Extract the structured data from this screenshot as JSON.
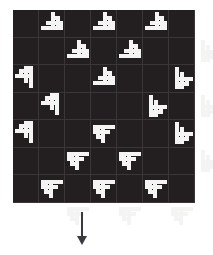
{
  "figure": {
    "kind": "pattern-grid-with-arrow",
    "background_color": "#ffffff",
    "arrow": {
      "direction": "down",
      "color": "#3a3a40",
      "x": 77,
      "y": 212,
      "length": 33,
      "shaft_width": 2,
      "head_width": 10,
      "head_height": 9
    }
  },
  "grid": {
    "x": 13,
    "y": 10,
    "width": 182,
    "height": 193,
    "columns": 7,
    "rows": 7,
    "cell_size": 26,
    "cell_color": "#231f20",
    "gridline_color": "#3b3538",
    "gridline_width": 1,
    "motif_color": "#f4f4f2",
    "motif_name": "staircase-pinwheel-block",
    "motif_unit": 26,
    "motif_bars": [
      {
        "x": 2,
        "y": 16,
        "w": 22,
        "h": 4
      },
      {
        "x": 7,
        "y": 11,
        "w": 17,
        "h": 4
      },
      {
        "x": 12,
        "y": 6,
        "w": 7,
        "h": 4
      },
      {
        "x": 12,
        "y": 2,
        "w": 4,
        "h": 14
      },
      {
        "x": 17,
        "y": 6,
        "w": 4,
        "h": 10
      },
      {
        "x": 21,
        "y": 11,
        "w": 3,
        "h": 5
      }
    ],
    "placements": [
      {
        "col": 1,
        "row": 0,
        "rotation": 0
      },
      {
        "col": 3,
        "row": 0,
        "rotation": 0
      },
      {
        "col": 5,
        "row": 0,
        "rotation": 0
      },
      {
        "col": 0,
        "row": 1,
        "rotation": 270
      },
      {
        "col": 2,
        "row": 1,
        "rotation": 0
      },
      {
        "col": 4,
        "row": 1,
        "rotation": 0
      },
      {
        "col": 6,
        "row": 1,
        "rotation": 90
      },
      {
        "col": 1,
        "row": 2,
        "rotation": 270
      },
      {
        "col": 3,
        "row": 2,
        "rotation": 0
      },
      {
        "col": 5,
        "row": 2,
        "rotation": 90
      },
      {
        "col": 0,
        "row": 3,
        "rotation": 270
      },
      {
        "col": 2,
        "row": 3,
        "rotation": 180
      },
      {
        "col": 4,
        "row": 3,
        "rotation": 90
      },
      {
        "col": 6,
        "row": 3,
        "rotation": 90
      },
      {
        "col": 1,
        "row": 4,
        "rotation": 180
      },
      {
        "col": 3,
        "row": 4,
        "rotation": 180
      },
      {
        "col": 5,
        "row": 4,
        "rotation": 90
      },
      {
        "col": 0,
        "row": 5,
        "rotation": 180
      },
      {
        "col": 2,
        "row": 5,
        "rotation": 180
      },
      {
        "col": 4,
        "row": 5,
        "rotation": 180
      },
      {
        "col": 6,
        "row": 5,
        "rotation": 90
      },
      {
        "col": 1,
        "row": 6,
        "rotation": 180
      },
      {
        "col": 3,
        "row": 6,
        "rotation": 180
      },
      {
        "col": 5,
        "row": 6,
        "rotation": 180
      }
    ]
  }
}
